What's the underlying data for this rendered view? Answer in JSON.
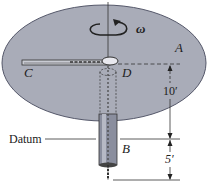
{
  "figure": {
    "labels": {
      "omega": "ω",
      "A": "A",
      "C": "C",
      "D": "D",
      "B": "B",
      "datum": "Datum"
    },
    "dimensions": {
      "upper": "10′",
      "lower": "5′"
    },
    "colors": {
      "disk_fill": "#a9acb8",
      "disk_stroke": "#55586a",
      "tube_fill": "#8a8e9e",
      "line": "#333333"
    }
  }
}
